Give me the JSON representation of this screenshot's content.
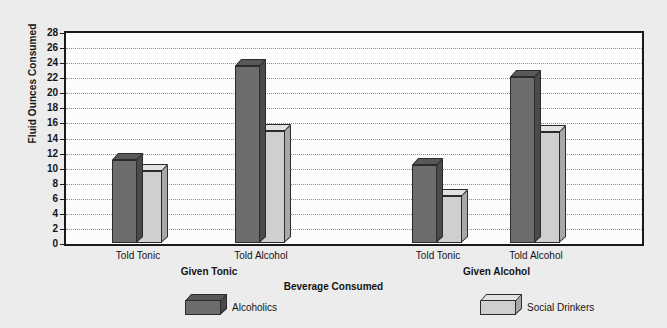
{
  "chart_data": {
    "type": "bar",
    "title": "",
    "xlabel": "Beverage Consumed",
    "ylabel": "Fluid Ounces Consumed",
    "ylim": [
      0,
      28
    ],
    "ytick_step": 2,
    "yticks": [
      28,
      26,
      24,
      22,
      20,
      18,
      16,
      14,
      12,
      10,
      8,
      6,
      4,
      2,
      0
    ],
    "grid": true,
    "grid_style": "dotted-horizontal",
    "legend_position": "bottom",
    "groups": [
      {
        "name": "Given Tonic",
        "categories": [
          "Told Tonic",
          "Told Alcohol"
        ]
      },
      {
        "name": "Given Alcohol",
        "categories": [
          "Told Tonic",
          "Told Alcohol"
        ]
      }
    ],
    "categories": [
      "Told Tonic",
      "Told Alcohol",
      "Told Tonic",
      "Told Alcohol"
    ],
    "series": [
      {
        "name": "Alcoholics",
        "color": "#6d6d6d",
        "values": [
          11.0,
          23.5,
          10.3,
          22.0
        ]
      },
      {
        "name": "Social Drinkers",
        "color": "#cfcfcf",
        "values": [
          9.6,
          14.8,
          6.2,
          14.7
        ]
      }
    ]
  },
  "legend": {
    "items": [
      {
        "label": "Alcoholics",
        "color": "#6d6d6d"
      },
      {
        "label": "Social Drinkers",
        "color": "#cfcfcf"
      }
    ]
  },
  "axes": {
    "y_title": "Fluid Ounces Consumed",
    "x_title": "Beverage Consumed"
  },
  "colors": {
    "background": "#ececec",
    "plot_background": "#fcfcfc",
    "axis": "#1a1a1a",
    "grid": "#8d8d8d",
    "series_dark": "#6d6d6d",
    "series_light": "#cfcfcf"
  }
}
